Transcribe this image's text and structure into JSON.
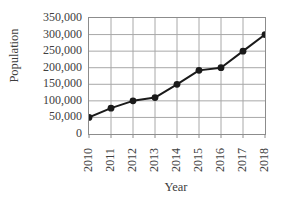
{
  "chart_data": {
    "type": "line",
    "title": "",
    "xlabel": "Year",
    "ylabel": "Population",
    "categories": [
      "2010",
      "2011",
      "2012",
      "2013",
      "2014",
      "2015",
      "2016",
      "2017",
      "2018"
    ],
    "values": [
      50000,
      78000,
      100000,
      110000,
      150000,
      192000,
      200000,
      250000,
      300000
    ],
    "series": [
      {
        "name": "Population",
        "values": [
          50000,
          78000,
          100000,
          110000,
          150000,
          192000,
          200000,
          250000,
          300000
        ]
      }
    ],
    "ylim": [
      0,
      350000
    ],
    "ytick_labels": [
      "350,000",
      "300,000",
      "250,000",
      "200,000",
      "150,000",
      "100,000",
      "50,000",
      "0"
    ],
    "ytick_values": [
      350000,
      300000,
      250000,
      200000,
      150000,
      100000,
      50000,
      0
    ],
    "xtick_labels": [
      "2010",
      "2011",
      "2012",
      "2013",
      "2014",
      "2015",
      "2016",
      "2017",
      "2018"
    ],
    "grid": true,
    "legend": "none",
    "marker": "filled-circle",
    "line_color": "#1a1a1a",
    "marker_color": "#1a1a1a",
    "grid_color": "#a8a8a8",
    "axis_color": "#8c8c8c",
    "text_color": "#3d3d3d",
    "background": "#ffffff"
  }
}
